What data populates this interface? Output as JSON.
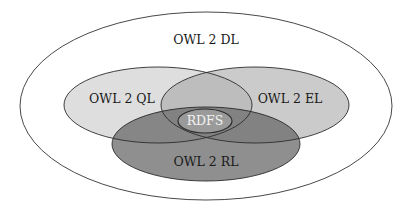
{
  "diagram": {
    "type": "venn",
    "sets": [
      {
        "id": "dl",
        "label": "OWL 2 DL",
        "fill": "#ffffff",
        "stroke": "#333333"
      },
      {
        "id": "ql",
        "label": "OWL 2 QL",
        "fill": "#dcdcdc",
        "stroke": "#333333"
      },
      {
        "id": "el",
        "label": "OWL 2 EL",
        "fill": "#c8c8c8",
        "stroke": "#333333"
      },
      {
        "id": "rl",
        "label": "OWL 2 RL",
        "fill": "#8c8c8c",
        "stroke": "#333333"
      },
      {
        "id": "rdfs",
        "label": "RDFS",
        "fill": "#999999",
        "stroke": "#333333"
      }
    ],
    "relations": [
      "OWL 2 QL ⊂ OWL 2 DL",
      "OWL 2 EL ⊂ OWL 2 DL",
      "OWL 2 RL ⊂ OWL 2 DL",
      "RDFS ⊂ OWL 2 QL ∩ OWL 2 EL ∩ OWL 2 RL"
    ]
  }
}
